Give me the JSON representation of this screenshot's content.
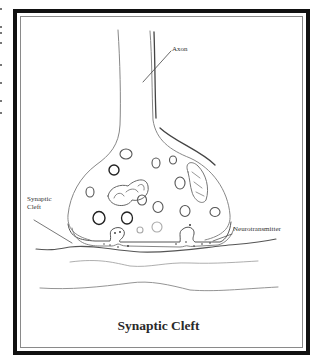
{
  "figure": {
    "title": "Synaptic Cleft",
    "labels": {
      "axon": "Axon",
      "synaptic_cleft_line1": "Synaptic",
      "synaptic_cleft_line2": "Cleft",
      "neurotransmitter": "Neurotransmitter"
    },
    "colors": {
      "frame": "#111111",
      "frame_inner": "#8a8a8a",
      "pencil": "#555555",
      "background": "#ffffff"
    }
  }
}
